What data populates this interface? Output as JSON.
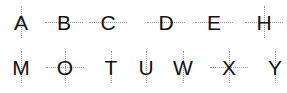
{
  "diagram": {
    "line_style": {
      "color": "#9a9a9a",
      "pattern": "dotted"
    },
    "rows": [
      {
        "letters": [
          {
            "char": "A",
            "vertical": true,
            "horizontal": false
          },
          {
            "char": "B",
            "vertical": false,
            "horizontal": true
          },
          {
            "char": "C",
            "vertical": false,
            "horizontal": true
          },
          {
            "char": "D",
            "vertical": false,
            "horizontal": true
          },
          {
            "char": "E",
            "vertical": false,
            "horizontal": true
          },
          {
            "char": "H",
            "vertical": true,
            "horizontal": true
          }
        ]
      },
      {
        "letters": [
          {
            "char": "M",
            "vertical": true,
            "horizontal": false
          },
          {
            "char": "O",
            "vertical": true,
            "horizontal": true
          },
          {
            "char": "T",
            "vertical": true,
            "horizontal": false
          },
          {
            "char": "U",
            "vertical": true,
            "horizontal": false
          },
          {
            "char": "W",
            "vertical": true,
            "horizontal": false
          },
          {
            "char": "X",
            "vertical": true,
            "horizontal": true
          },
          {
            "char": "Y",
            "vertical": true,
            "horizontal": false
          }
        ]
      }
    ]
  }
}
